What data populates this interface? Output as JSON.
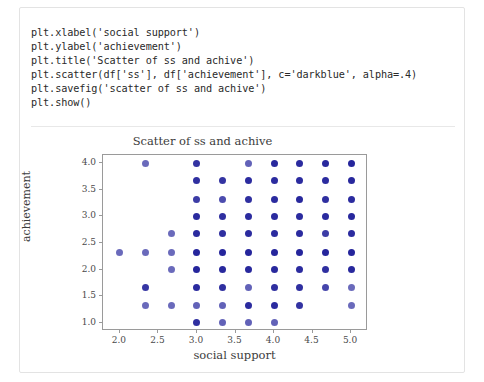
{
  "card": {
    "code": {
      "lines": [
        "plt.xlabel('social support')",
        "plt.ylabel('achievement')",
        "plt.title('Scatter of ss and achive')",
        "plt.scatter(df['ss'], df['achievement'], c='darkblue', alpha=.4)",
        "plt.savefig('scatter of ss and achive')",
        "plt.show()"
      ]
    }
  },
  "chart_data": {
    "type": "scatter",
    "title": "Scatter of ss and achive",
    "xlabel": "social support",
    "ylabel": "achievement",
    "xlim": [
      1.78,
      5.22
    ],
    "ylim": [
      0.84,
      4.16
    ],
    "xticks": [
      2.0,
      2.5,
      3.0,
      3.5,
      4.0,
      4.5,
      5.0
    ],
    "xtick_labels": [
      "2.0",
      "2.5",
      "3.0",
      "3.5",
      "4.0",
      "4.5",
      "5.0"
    ],
    "yticks": [
      1.0,
      1.5,
      2.0,
      2.5,
      3.0,
      3.5,
      4.0
    ],
    "ytick_labels": [
      "1.0",
      "1.5",
      "2.0",
      "2.5",
      "3.0",
      "3.5",
      "4.0"
    ],
    "grid": false,
    "legend": false,
    "marker_color": "#00008b",
    "marker_alpha": 0.4,
    "marker_size": 7,
    "series": [
      {
        "name": "achievement vs social support",
        "points": [
          {
            "x": 2.33,
            "y": 4.0,
            "density": 0.35
          },
          {
            "x": 3.0,
            "y": 4.0,
            "density": 0.8
          },
          {
            "x": 3.67,
            "y": 4.0,
            "density": 0.4
          },
          {
            "x": 4.0,
            "y": 4.0,
            "density": 0.95
          },
          {
            "x": 4.33,
            "y": 4.0,
            "density": 0.9
          },
          {
            "x": 4.67,
            "y": 4.0,
            "density": 0.95
          },
          {
            "x": 5.0,
            "y": 4.0,
            "density": 1.0
          },
          {
            "x": 3.0,
            "y": 3.67,
            "density": 0.85
          },
          {
            "x": 3.33,
            "y": 3.67,
            "density": 0.8
          },
          {
            "x": 3.67,
            "y": 3.67,
            "density": 0.9
          },
          {
            "x": 4.0,
            "y": 3.67,
            "density": 0.9
          },
          {
            "x": 4.33,
            "y": 3.67,
            "density": 0.9
          },
          {
            "x": 4.67,
            "y": 3.67,
            "density": 0.9
          },
          {
            "x": 5.0,
            "y": 3.67,
            "density": 0.95
          },
          {
            "x": 3.0,
            "y": 3.33,
            "density": 0.7
          },
          {
            "x": 3.33,
            "y": 3.33,
            "density": 0.55
          },
          {
            "x": 3.67,
            "y": 3.33,
            "density": 0.85
          },
          {
            "x": 4.0,
            "y": 3.33,
            "density": 0.9
          },
          {
            "x": 4.33,
            "y": 3.33,
            "density": 0.95
          },
          {
            "x": 4.67,
            "y": 3.33,
            "density": 0.85
          },
          {
            "x": 5.0,
            "y": 3.33,
            "density": 0.9
          },
          {
            "x": 3.0,
            "y": 3.0,
            "density": 0.9
          },
          {
            "x": 3.33,
            "y": 3.0,
            "density": 0.85
          },
          {
            "x": 3.67,
            "y": 3.0,
            "density": 0.9
          },
          {
            "x": 4.0,
            "y": 3.0,
            "density": 0.9
          },
          {
            "x": 4.33,
            "y": 3.0,
            "density": 0.9
          },
          {
            "x": 4.67,
            "y": 3.0,
            "density": 0.9
          },
          {
            "x": 5.0,
            "y": 3.0,
            "density": 0.95
          },
          {
            "x": 2.67,
            "y": 2.67,
            "density": 0.35
          },
          {
            "x": 3.0,
            "y": 2.67,
            "density": 0.9
          },
          {
            "x": 3.33,
            "y": 2.67,
            "density": 0.85
          },
          {
            "x": 3.67,
            "y": 2.67,
            "density": 0.9
          },
          {
            "x": 4.0,
            "y": 2.67,
            "density": 0.9
          },
          {
            "x": 4.33,
            "y": 2.67,
            "density": 0.9
          },
          {
            "x": 4.67,
            "y": 2.67,
            "density": 0.7
          },
          {
            "x": 5.0,
            "y": 2.67,
            "density": 0.9
          },
          {
            "x": 2.0,
            "y": 2.33,
            "density": 0.35
          },
          {
            "x": 2.33,
            "y": 2.33,
            "density": 0.35
          },
          {
            "x": 2.67,
            "y": 2.33,
            "density": 0.35
          },
          {
            "x": 3.0,
            "y": 2.33,
            "density": 1.0
          },
          {
            "x": 3.33,
            "y": 2.33,
            "density": 1.0
          },
          {
            "x": 3.67,
            "y": 2.33,
            "density": 1.0
          },
          {
            "x": 4.0,
            "y": 2.33,
            "density": 1.0
          },
          {
            "x": 4.33,
            "y": 2.33,
            "density": 1.0
          },
          {
            "x": 4.67,
            "y": 2.33,
            "density": 1.0
          },
          {
            "x": 5.0,
            "y": 2.33,
            "density": 1.0
          },
          {
            "x": 2.67,
            "y": 2.0,
            "density": 0.35
          },
          {
            "x": 3.0,
            "y": 2.0,
            "density": 1.0
          },
          {
            "x": 3.33,
            "y": 2.0,
            "density": 0.95
          },
          {
            "x": 3.67,
            "y": 2.0,
            "density": 0.95
          },
          {
            "x": 4.0,
            "y": 2.0,
            "density": 0.95
          },
          {
            "x": 4.33,
            "y": 2.0,
            "density": 0.9
          },
          {
            "x": 4.67,
            "y": 2.0,
            "density": 0.85
          },
          {
            "x": 5.0,
            "y": 2.0,
            "density": 0.95
          },
          {
            "x": 2.33,
            "y": 1.67,
            "density": 0.75
          },
          {
            "x": 3.0,
            "y": 1.67,
            "density": 0.9
          },
          {
            "x": 3.33,
            "y": 1.67,
            "density": 0.85
          },
          {
            "x": 3.67,
            "y": 1.67,
            "density": 0.4
          },
          {
            "x": 4.0,
            "y": 1.67,
            "density": 0.85
          },
          {
            "x": 4.33,
            "y": 1.67,
            "density": 0.85
          },
          {
            "x": 4.67,
            "y": 1.67,
            "density": 0.6
          },
          {
            "x": 5.0,
            "y": 1.67,
            "density": 0.35
          },
          {
            "x": 2.33,
            "y": 1.33,
            "density": 0.35
          },
          {
            "x": 2.67,
            "y": 1.33,
            "density": 0.35
          },
          {
            "x": 3.0,
            "y": 1.33,
            "density": 0.4
          },
          {
            "x": 3.33,
            "y": 1.33,
            "density": 0.4
          },
          {
            "x": 3.67,
            "y": 1.33,
            "density": 0.9
          },
          {
            "x": 4.0,
            "y": 1.33,
            "density": 0.9
          },
          {
            "x": 4.33,
            "y": 1.33,
            "density": 0.8
          },
          {
            "x": 5.0,
            "y": 1.33,
            "density": 0.35
          },
          {
            "x": 3.0,
            "y": 1.0,
            "density": 0.85
          },
          {
            "x": 3.33,
            "y": 1.0,
            "density": 0.4
          },
          {
            "x": 3.67,
            "y": 1.0,
            "density": 0.4
          },
          {
            "x": 4.0,
            "y": 1.0,
            "density": 0.4
          }
        ]
      }
    ]
  }
}
